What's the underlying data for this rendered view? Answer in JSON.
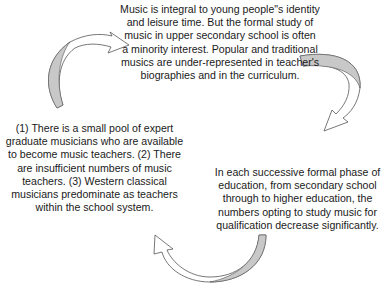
{
  "diagram": {
    "type": "cycle",
    "nodes": [
      {
        "id": "top",
        "text": "Music is integral to young people\"s identity and leisure time. But the formal study of music in upper secondary school is often a minority interest. Popular and traditional musics are under-represented in teacher's biographies and in the curriculum."
      },
      {
        "id": "right",
        "text": "In each successive formal phase of education, from secondary school through to higher education, the numbers opting to study music for qualification decrease significantly."
      },
      {
        "id": "left",
        "text": "(1) There is a small pool of expert graduate musicians who are available to become music teachers. (2) There are insufficient numbers of music teachers. (3) Western classical musicians predominate as teachers within the school system."
      }
    ],
    "arrows": [
      {
        "from": "left",
        "to": "top",
        "icon": "curved-arrow-icon"
      },
      {
        "from": "top",
        "to": "right",
        "icon": "curved-arrow-icon"
      },
      {
        "from": "right",
        "to": "left",
        "icon": "curved-arrow-icon"
      }
    ],
    "colors": {
      "text": "#1a1a1a",
      "arrow_outline": "#555555",
      "arrow_shade": "#c8c8c8",
      "arrow_fill": "#ffffff"
    }
  }
}
